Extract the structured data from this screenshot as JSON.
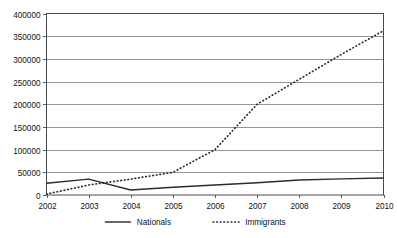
{
  "chart_data": {
    "type": "line",
    "title": "",
    "xlabel": "",
    "ylabel": "",
    "categories": [
      "2002",
      "2003",
      "2004",
      "2005",
      "2006",
      "2007",
      "2008",
      "2009",
      "2010"
    ],
    "x": [
      2002,
      2003,
      2004,
      2005,
      2006,
      2007,
      2008,
      2009,
      2010
    ],
    "series": [
      {
        "name": "Nationals",
        "style": "solid",
        "color": "#2b2b2b",
        "values": [
          26000,
          35000,
          11000,
          17000,
          22000,
          27000,
          33000,
          35500,
          37500
        ]
      },
      {
        "name": "Immigrants",
        "style": "dotted",
        "color": "#2b2b2b",
        "values": [
          2000,
          22000,
          35000,
          50000,
          100000,
          200000,
          255000,
          310000,
          362000
        ]
      }
    ],
    "ylim": [
      0,
      400000
    ],
    "ytick_step": 50000,
    "ytick_labels": [
      "0",
      "50000",
      "100000",
      "150000",
      "200000",
      "250000",
      "300000",
      "350000",
      "400000"
    ],
    "ytick_values": [
      0,
      50000,
      100000,
      150000,
      200000,
      250000,
      300000,
      350000,
      400000
    ],
    "xtick_labels": [
      "2002",
      "2003",
      "2004",
      "2005",
      "2006",
      "2007",
      "2008",
      "2009",
      "2010"
    ],
    "grid": "horizontal",
    "legend_position": "bottom",
    "legend": [
      {
        "label": "Nationals",
        "style": "solid"
      },
      {
        "label": "Immigrants",
        "style": "dotted"
      }
    ]
  },
  "colors": {
    "background": "#ffffff",
    "axis": "#4a4a4a",
    "grid": "#8a8a8a",
    "ink": "#2b2b2b",
    "text": "#111111"
  }
}
